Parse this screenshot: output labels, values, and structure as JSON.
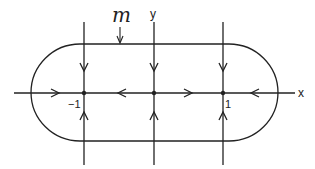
{
  "diagram": {
    "type": "phase-portrait",
    "colors": {
      "stroke": "#222222",
      "background": "#ffffff"
    },
    "labels": {
      "curve": "m",
      "x_axis": "x",
      "y_axis": "y",
      "tick_neg": "−1",
      "tick_pos": "1"
    },
    "equilibria": [
      {
        "name": "equilibrium-neg-one",
        "x": -1,
        "y": 0
      },
      {
        "name": "equilibrium-origin",
        "x": 0,
        "y": 0
      },
      {
        "name": "equilibrium-pos-one",
        "x": 1,
        "y": 0
      }
    ],
    "flow": {
      "x_axis": [
        "right",
        "left",
        "right",
        "left"
      ],
      "vertical_lines_above_axis": "down",
      "vertical_lines_below_axis": "up"
    },
    "invariant_curve": "stadium-shaped closed curve m with semicircular ends through x-axis outside ±1"
  }
}
